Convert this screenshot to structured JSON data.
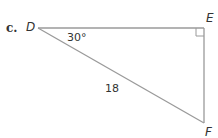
{
  "problem": {
    "part_label": "c.",
    "vertices": {
      "D": "D",
      "E": "E",
      "F": "F"
    },
    "angle_D": "30°",
    "hypotenuse_DF": "18",
    "right_angle_at": "E"
  },
  "colors": {
    "line": "#9a9a9a",
    "text": "#333333"
  }
}
